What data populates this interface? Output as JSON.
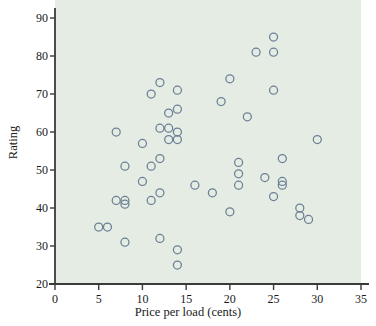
{
  "chart_data": {
    "type": "scatter",
    "title": "",
    "xlabel": "Price per load (cents)",
    "ylabel": "Rating",
    "xlim": [
      0,
      35
    ],
    "ylim": [
      20,
      90
    ],
    "xticks": [
      0,
      5,
      10,
      15,
      20,
      25,
      30,
      35
    ],
    "yticks": [
      20,
      30,
      40,
      50,
      60,
      70,
      80,
      90
    ],
    "grid": false,
    "legend": null,
    "marker": {
      "shape": "circle",
      "filled": false,
      "edge_color": "#6b7f95",
      "radius_px": 4
    },
    "background_color": "#e4ece4",
    "axis_color": "#3a3a3a",
    "points": [
      {
        "x": 5,
        "y": 35
      },
      {
        "x": 6,
        "y": 35
      },
      {
        "x": 7,
        "y": 60
      },
      {
        "x": 7,
        "y": 42
      },
      {
        "x": 8,
        "y": 51
      },
      {
        "x": 8,
        "y": 42
      },
      {
        "x": 8,
        "y": 41
      },
      {
        "x": 8,
        "y": 31
      },
      {
        "x": 10,
        "y": 57
      },
      {
        "x": 10,
        "y": 47
      },
      {
        "x": 11,
        "y": 70
      },
      {
        "x": 11,
        "y": 51
      },
      {
        "x": 11,
        "y": 42
      },
      {
        "x": 12,
        "y": 73
      },
      {
        "x": 12,
        "y": 61
      },
      {
        "x": 12,
        "y": 53
      },
      {
        "x": 12,
        "y": 44
      },
      {
        "x": 12,
        "y": 32
      },
      {
        "x": 13,
        "y": 65
      },
      {
        "x": 13,
        "y": 61
      },
      {
        "x": 13,
        "y": 58
      },
      {
        "x": 14,
        "y": 71
      },
      {
        "x": 14,
        "y": 66
      },
      {
        "x": 14,
        "y": 60
      },
      {
        "x": 14,
        "y": 58
      },
      {
        "x": 14,
        "y": 29
      },
      {
        "x": 14,
        "y": 25
      },
      {
        "x": 16,
        "y": 46
      },
      {
        "x": 18,
        "y": 44
      },
      {
        "x": 19,
        "y": 68
      },
      {
        "x": 20,
        "y": 74
      },
      {
        "x": 20,
        "y": 39
      },
      {
        "x": 21,
        "y": 52
      },
      {
        "x": 21,
        "y": 49
      },
      {
        "x": 21,
        "y": 46
      },
      {
        "x": 22,
        "y": 64
      },
      {
        "x": 23,
        "y": 81
      },
      {
        "x": 24,
        "y": 48
      },
      {
        "x": 25,
        "y": 85
      },
      {
        "x": 25,
        "y": 81
      },
      {
        "x": 25,
        "y": 71
      },
      {
        "x": 25,
        "y": 43
      },
      {
        "x": 26,
        "y": 53
      },
      {
        "x": 26,
        "y": 47
      },
      {
        "x": 26,
        "y": 46
      },
      {
        "x": 28,
        "y": 40
      },
      {
        "x": 28,
        "y": 38
      },
      {
        "x": 29,
        "y": 37
      },
      {
        "x": 30,
        "y": 58
      }
    ]
  }
}
